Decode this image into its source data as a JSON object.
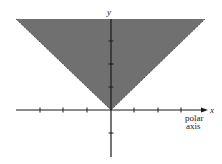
{
  "diagram": {
    "type": "polar-region",
    "labels": {
      "x_axis": "x",
      "y_axis": "y",
      "polar_axis_line1": "polar",
      "polar_axis_line2": "axis"
    },
    "colors": {
      "fill": "#707070",
      "axis": "#1a1a1a",
      "background": "#ffffff"
    },
    "region": {
      "ray_left_angle": "3π/4",
      "ray_right_angle": "π/4",
      "boundary": "dashed"
    },
    "ticks": {
      "x_negative_count": 3,
      "x_positive_count": 3,
      "y_positive_count": 3,
      "y_negative_count": 1
    }
  }
}
